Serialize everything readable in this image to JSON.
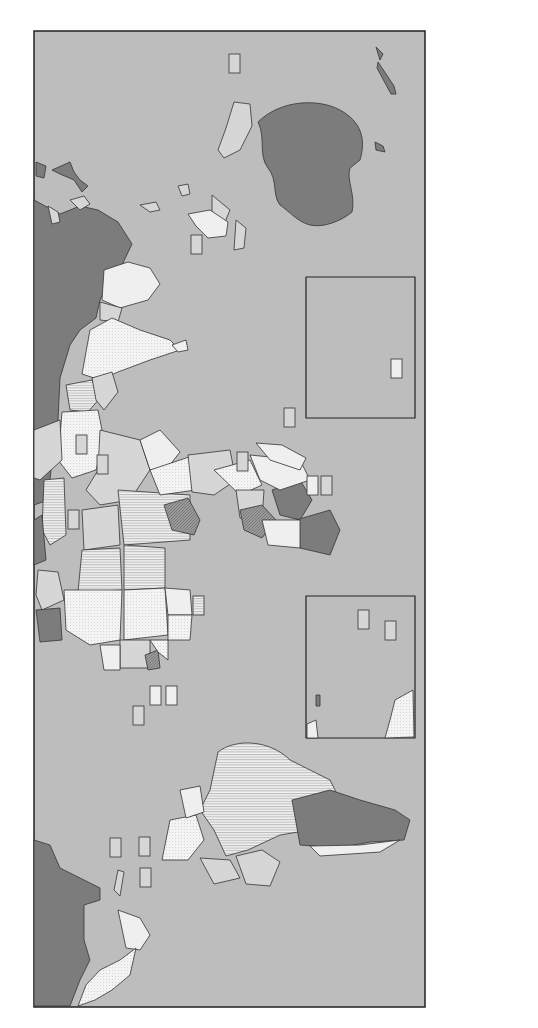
{
  "map": {
    "title": "Hectares of cropland per capita",
    "orientation": "rotated 90 degrees counter-clockwise",
    "colors": {
      "ocean": "#bdbdbd",
      "less_than_20": "#d6d6d6",
      "range_20_40": "#efefef",
      "range_41_60": "#e4e4e4",
      "range_61_80": "#8f8f8f",
      "more_than_100": "#7c7c7c",
      "not_available": "#ffffff",
      "border": "#333333"
    }
  },
  "legend": {
    "title": "Hectares of cropland per capita",
    "items": [
      {
        "label": "Less than .20 hectares",
        "pattern": "light-gray"
      },
      {
        "label": ".20-.40 hectares",
        "pattern": "dotted"
      },
      {
        "label": ".41-.60 hectares",
        "pattern": "horizontal-lines"
      },
      {
        "label": ".61-.80 hectares",
        "pattern": "diagonal-dark"
      },
      {
        "label": "More than 1.00 hectares",
        "pattern": "dark-gray"
      },
      {
        "label": "Data not available",
        "pattern": "white"
      }
    ]
  }
}
